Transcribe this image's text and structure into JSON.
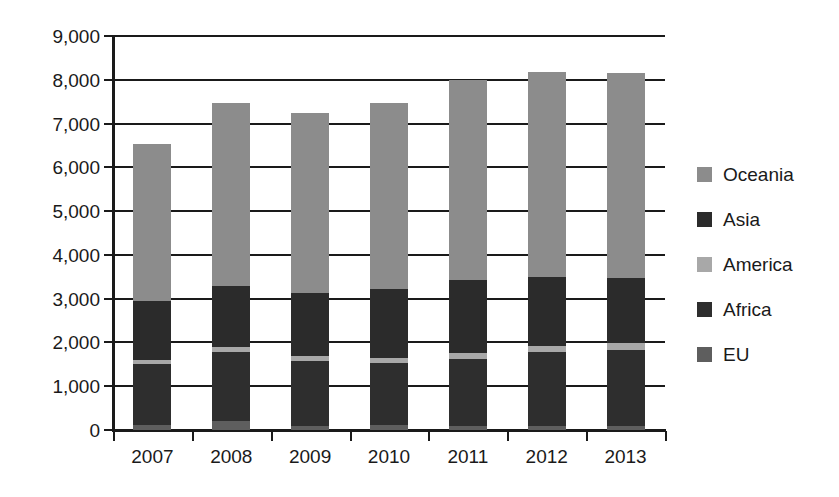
{
  "chart_data": {
    "type": "bar",
    "stacked": true,
    "title": "",
    "subtitle": "",
    "xlabel": "",
    "ylabel": "",
    "categories": [
      "2007",
      "2008",
      "2009",
      "2010",
      "2011",
      "2012",
      "2013"
    ],
    "ylim": [
      0,
      9000
    ],
    "ytick_labels": [
      "0",
      "1,000",
      "2,000",
      "3,000",
      "4,000",
      "5,000",
      "6,000",
      "7,000",
      "8,000",
      "9,000"
    ],
    "ytick_values": [
      0,
      1000,
      2000,
      3000,
      4000,
      5000,
      6000,
      7000,
      8000,
      9000
    ],
    "ytick_step": 1000,
    "grid": true,
    "legend_position": "right",
    "stack_order_bottom_to_top": [
      "EU",
      "Africa",
      "America",
      "Asia",
      "Oceania"
    ],
    "series": [
      {
        "name": "EU",
        "color": "#5e5e5e",
        "values": [
          120,
          210,
          100,
          110,
          100,
          90,
          90
        ]
      },
      {
        "name": "Africa",
        "color": "#2e2e2e",
        "values": [
          1380,
          1580,
          1480,
          1430,
          1520,
          1700,
          1740
        ]
      },
      {
        "name": "America",
        "color": "#a8a8a8",
        "values": [
          110,
          110,
          110,
          110,
          150,
          140,
          150
        ]
      },
      {
        "name": "Asia",
        "color": "#2b2b2b",
        "values": [
          1340,
          1400,
          1440,
          1580,
          1650,
          1570,
          1500
        ]
      },
      {
        "name": "Oceania",
        "color": "#8c8c8c",
        "values": [
          3580,
          4180,
          4120,
          4240,
          4580,
          4680,
          4670
        ]
      }
    ],
    "totals": [
      6530,
      7480,
      7250,
      7470,
      8000,
      8160,
      8150
    ]
  },
  "legend": {
    "items": [
      {
        "label": "Oceania",
        "swatch_name": "legend-swatch-oceania",
        "color": "#8c8c8c"
      },
      {
        "label": "Asia",
        "swatch_name": "legend-swatch-asia",
        "color": "#2b2b2b"
      },
      {
        "label": "America",
        "swatch_name": "legend-swatch-america",
        "color": "#a8a8a8"
      },
      {
        "label": "Africa",
        "swatch_name": "legend-swatch-africa",
        "color": "#2e2e2e"
      },
      {
        "label": "EU",
        "swatch_name": "legend-swatch-eu",
        "color": "#5e5e5e"
      }
    ]
  },
  "axes": {
    "axis_color": "#1a1a1a",
    "gridline_color": "#1a1a1a"
  }
}
